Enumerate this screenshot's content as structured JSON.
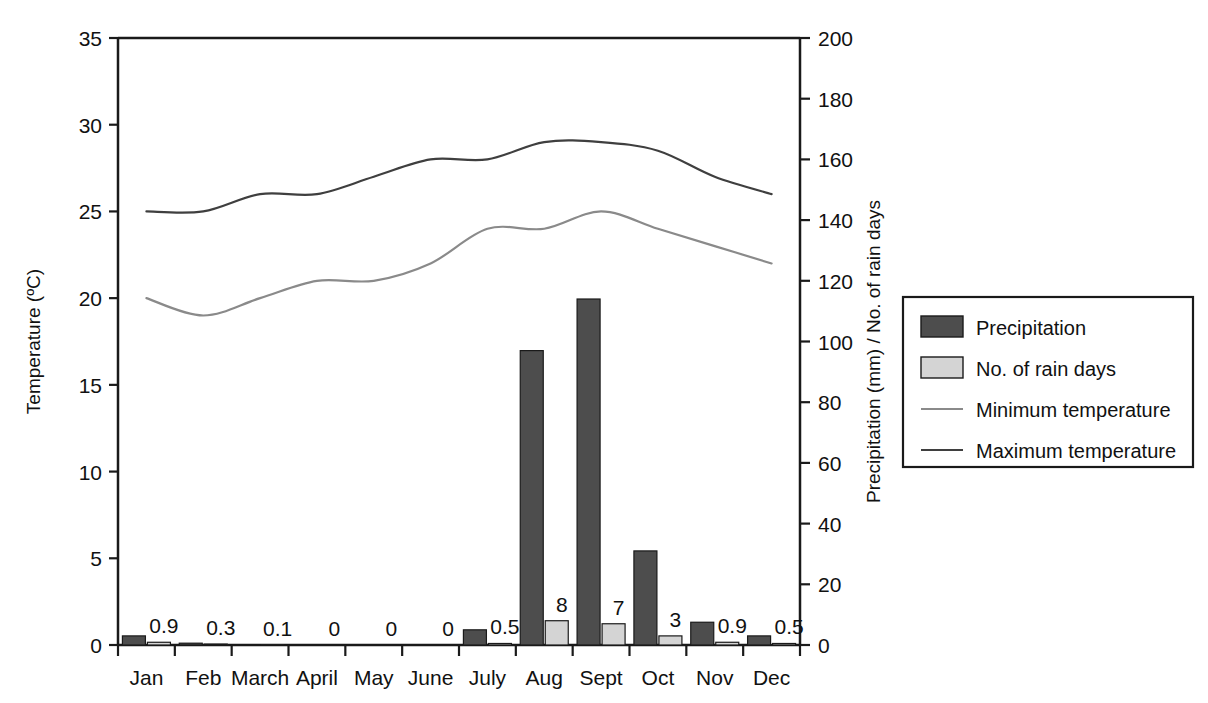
{
  "chart_data": {
    "type": "bar",
    "title": "",
    "subtitle": "",
    "categories": [
      "Jan",
      "Feb",
      "March",
      "April",
      "May",
      "June",
      "July",
      "Aug",
      "Sept",
      "Oct",
      "Nov",
      "Dec"
    ],
    "series": [
      {
        "name": "Precipitation",
        "unit": "mm",
        "axis": "right",
        "render": "bar",
        "color": "#4d4d4d",
        "values": [
          3,
          0.6,
          0,
          0,
          0,
          0,
          5,
          97,
          114,
          31,
          7.5,
          3
        ]
      },
      {
        "name": "No. of rain days",
        "unit": "days",
        "axis": "right",
        "render": "bar",
        "color": "#d4d4d4",
        "values": [
          0.9,
          0.3,
          0.1,
          0,
          0,
          0,
          0.5,
          8,
          7,
          3,
          0.9,
          0.5
        ],
        "data_labels": [
          "0.9",
          "0.3",
          "0.1",
          "0",
          "0",
          "0",
          "0.5",
          "8",
          "7",
          "3",
          "0.9",
          "0.5"
        ]
      },
      {
        "name": "Minimum temperature",
        "unit": "°C",
        "axis": "left",
        "render": "line",
        "color": "#8a8a8a",
        "values": [
          20,
          19,
          20,
          21,
          21,
          22,
          24,
          24,
          25,
          24,
          23,
          22
        ]
      },
      {
        "name": "Maximum temperature",
        "unit": "°C",
        "axis": "left",
        "render": "line",
        "color": "#3f3f3f",
        "values": [
          25,
          25,
          26,
          26,
          27,
          28,
          28,
          29,
          29,
          28.5,
          27,
          26
        ]
      }
    ],
    "left_axis": {
      "label": "Temperature (ºC)",
      "ticks": [
        "0",
        "5",
        "10",
        "15",
        "20",
        "25",
        "30",
        "35"
      ],
      "min": 0,
      "max": 35
    },
    "right_axis": {
      "label": "Precipitation (mm) / No. of rain days",
      "ticks": [
        "0",
        "20",
        "40",
        "60",
        "80",
        "100",
        "120",
        "140",
        "160",
        "180",
        "200"
      ],
      "min": 0,
      "max": 200
    },
    "xlabel": "",
    "grid": false,
    "legend_position": "right",
    "legend": [
      {
        "label": "Precipitation",
        "marker": "swatch",
        "color": "#4d4d4d"
      },
      {
        "label": "No. of rain days",
        "marker": "swatch",
        "color": "#d4d4d4"
      },
      {
        "label": "Minimum temperature",
        "marker": "line",
        "color": "#8a8a8a"
      },
      {
        "label": "Maximum temperature",
        "marker": "line",
        "color": "#3f3f3f"
      }
    ]
  }
}
